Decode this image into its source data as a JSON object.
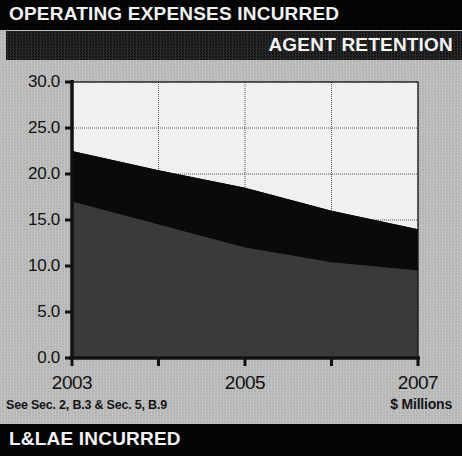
{
  "header": {
    "title": "OPERATING EXPENSES INCURRED",
    "subtitle": "AGENT RETENTION"
  },
  "footer": {
    "label": "L&LAE INCURRED"
  },
  "notes": {
    "source": "See Sec. 2, B.3 & Sec. 5, B.9",
    "units": "$ Millions"
  },
  "colors": {
    "band_bottom": "#3a3a3a",
    "band_middle": "#0a0a0a",
    "band_top": "#f0f0f0",
    "axis": "#111111",
    "grid": "#555555",
    "panel": "#bdbdbd",
    "header_bg": "#050505"
  },
  "chart_data": {
    "type": "area",
    "title": "OPERATING EXPENSES INCURRED",
    "subtitle": "AGENT RETENTION",
    "xlabel": "",
    "ylabel": "$ Millions",
    "x": [
      2003,
      2004,
      2005,
      2006,
      2007
    ],
    "xtick_labels": [
      "2003",
      "2005",
      "2007"
    ],
    "xtick_values": [
      2003,
      2005,
      2007
    ],
    "ytick_labels": [
      "0.0",
      "5.0",
      "10.0",
      "15.0",
      "20.0",
      "25.0",
      "30.0"
    ],
    "ytick_values": [
      0.0,
      5.0,
      10.0,
      15.0,
      20.0,
      25.0,
      30.0
    ],
    "xlim": [
      2003,
      2007
    ],
    "ylim": [
      0.0,
      30.0
    ],
    "grid": true,
    "legend": null,
    "stacked": true,
    "series": [
      {
        "name": "L&LAE Incurred",
        "color": "#3a3a3a",
        "values": [
          17.0,
          14.5,
          12.0,
          10.4,
          9.5
        ]
      },
      {
        "name": "Operating Expenses Incurred",
        "color": "#0a0a0a",
        "values": [
          5.5,
          5.9,
          6.5,
          5.6,
          4.5
        ]
      },
      {
        "name": "Agent Retention",
        "color": "#f0f0f0",
        "values": [
          7.5,
          9.6,
          11.5,
          14.0,
          16.0
        ]
      }
    ],
    "cumulative_tops": {
      "lower_band_top": [
        17.0,
        14.5,
        12.0,
        10.4,
        9.5
      ],
      "middle_band_top": [
        22.5,
        20.4,
        18.5,
        16.0,
        14.0
      ],
      "upper_band_top": [
        30.0,
        30.0,
        30.0,
        30.0,
        30.0
      ]
    }
  }
}
